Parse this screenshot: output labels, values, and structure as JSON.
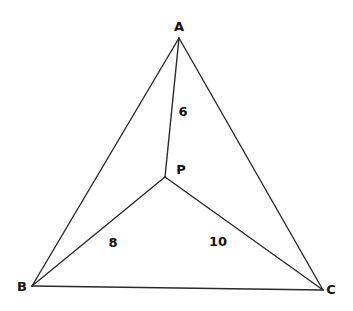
{
  "diagram": {
    "type": "geometry",
    "vertices": {
      "A": {
        "label": "A"
      },
      "B": {
        "label": "B"
      },
      "C": {
        "label": "C"
      },
      "P": {
        "label": "P"
      }
    },
    "segments": [
      {
        "from": "A",
        "to": "B"
      },
      {
        "from": "B",
        "to": "C"
      },
      {
        "from": "C",
        "to": "A"
      },
      {
        "from": "P",
        "to": "A",
        "length_label": "6"
      },
      {
        "from": "P",
        "to": "B",
        "length_label": "8"
      },
      {
        "from": "P",
        "to": "C",
        "length_label": "10"
      }
    ],
    "colors": {
      "line": "#2a2a2a",
      "text": "#111111",
      "background": "#ffffff"
    }
  }
}
